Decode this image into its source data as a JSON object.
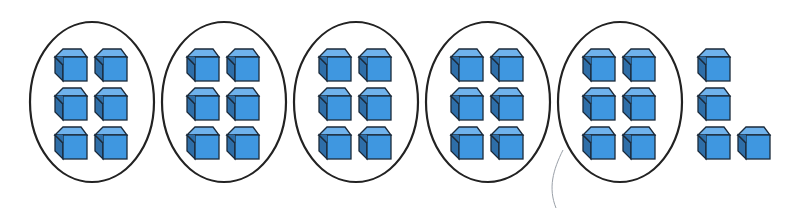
{
  "diagram": {
    "colors": {
      "cube_front": "#3f97e0",
      "cube_top": "#6fb2ec",
      "cube_side": "#2e6ea8",
      "outline": "#1b2a3a",
      "oval": "#222222",
      "pen_mark": "#9aa0a8"
    },
    "groups": [
      {
        "cx": 92,
        "cy": 102,
        "rx": 62,
        "ry": 80,
        "cubes": 6
      },
      {
        "cx": 224,
        "cy": 102,
        "rx": 62,
        "ry": 80,
        "cubes": 6
      },
      {
        "cx": 356,
        "cy": 102,
        "rx": 62,
        "ry": 80,
        "cubes": 6
      },
      {
        "cx": 488,
        "cy": 102,
        "rx": 62,
        "ry": 80,
        "cubes": 6
      },
      {
        "cx": 620,
        "cy": 102,
        "rx": 62,
        "ry": 80,
        "cubes": 6
      }
    ],
    "leftover_cubes": [
      {
        "x": 698,
        "y": 49
      },
      {
        "x": 698,
        "y": 88
      },
      {
        "x": 698,
        "y": 127
      },
      {
        "x": 738,
        "y": 127
      }
    ],
    "total_groups": 5,
    "cubes_per_group": 6,
    "leftover_count": 4
  }
}
